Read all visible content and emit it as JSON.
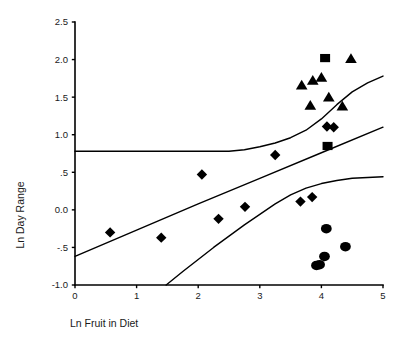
{
  "chart_data": {
    "type": "scatter",
    "title": "",
    "xlabel": "Ln Fruit in Diet",
    "ylabel": "Ln Day Range",
    "xlim": [
      0,
      5
    ],
    "ylim": [
      -1.0,
      2.5
    ],
    "xticks": [
      0,
      1,
      2,
      3,
      4,
      5
    ],
    "xticklabels": [
      "0",
      "1",
      "2",
      "3",
      "4",
      "5"
    ],
    "yticks": [
      -1.0,
      -0.5,
      0.0,
      0.5,
      1.0,
      1.5,
      2.0,
      2.5
    ],
    "yticklabels": [
      "-1.0",
      "-.5",
      "0.0",
      ".5",
      "1.0",
      "1.5",
      "2.0",
      "2.5"
    ],
    "grid": false,
    "legend": null,
    "legend_position": "none",
    "marker_color": "#000000",
    "line_color": "#000000",
    "series": [
      {
        "name": "diamond-group",
        "marker": "diamond",
        "points": [
          {
            "x": 0.57,
            "y": -0.3
          },
          {
            "x": 1.4,
            "y": -0.37
          },
          {
            "x": 2.06,
            "y": 0.47
          },
          {
            "x": 2.33,
            "y": -0.12
          },
          {
            "x": 2.76,
            "y": 0.04
          },
          {
            "x": 3.25,
            "y": 0.73
          },
          {
            "x": 3.66,
            "y": 0.11
          },
          {
            "x": 3.85,
            "y": 0.17
          },
          {
            "x": 4.09,
            "y": 1.11
          },
          {
            "x": 4.2,
            "y": 1.1
          }
        ]
      },
      {
        "name": "triangle-group",
        "marker": "triangle",
        "points": [
          {
            "x": 3.68,
            "y": 1.66
          },
          {
            "x": 3.82,
            "y": 1.39
          },
          {
            "x": 3.86,
            "y": 1.72
          },
          {
            "x": 4.0,
            "y": 1.76
          },
          {
            "x": 4.12,
            "y": 1.5
          },
          {
            "x": 4.34,
            "y": 1.38
          },
          {
            "x": 4.48,
            "y": 2.01
          }
        ]
      },
      {
        "name": "square-group",
        "marker": "square",
        "points": [
          {
            "x": 4.06,
            "y": 2.02
          },
          {
            "x": 4.1,
            "y": 0.85
          }
        ]
      },
      {
        "name": "circle-group",
        "marker": "circle",
        "points": [
          {
            "x": 4.08,
            "y": -0.25
          },
          {
            "x": 4.05,
            "y": -0.62
          },
          {
            "x": 4.39,
            "y": -0.49
          },
          {
            "x": 3.92,
            "y": -0.74
          },
          {
            "x": 3.97,
            "y": -0.73
          }
        ]
      }
    ],
    "curves": [
      {
        "name": "upper-confidence-band",
        "points": [
          {
            "x": 0.0,
            "y": 0.78
          },
          {
            "x": 0.5,
            "y": 0.78
          },
          {
            "x": 1.0,
            "y": 0.78
          },
          {
            "x": 1.5,
            "y": 0.78
          },
          {
            "x": 2.0,
            "y": 0.78
          },
          {
            "x": 2.5,
            "y": 0.78
          },
          {
            "x": 2.75,
            "y": 0.8
          },
          {
            "x": 3.0,
            "y": 0.84
          },
          {
            "x": 3.25,
            "y": 0.89
          },
          {
            "x": 3.5,
            "y": 0.96
          },
          {
            "x": 3.75,
            "y": 1.06
          },
          {
            "x": 4.0,
            "y": 1.21
          },
          {
            "x": 4.25,
            "y": 1.4
          },
          {
            "x": 4.5,
            "y": 1.57
          },
          {
            "x": 4.75,
            "y": 1.69
          },
          {
            "x": 5.0,
            "y": 1.78
          }
        ]
      },
      {
        "name": "regression-line",
        "points": [
          {
            "x": 0.0,
            "y": -0.62
          },
          {
            "x": 1.0,
            "y": -0.27
          },
          {
            "x": 2.0,
            "y": 0.08
          },
          {
            "x": 3.0,
            "y": 0.42
          },
          {
            "x": 4.0,
            "y": 0.76
          },
          {
            "x": 5.0,
            "y": 1.1
          }
        ]
      },
      {
        "name": "lower-confidence-band",
        "points": [
          {
            "x": 1.48,
            "y": -1.0
          },
          {
            "x": 1.75,
            "y": -0.82
          },
          {
            "x": 2.0,
            "y": -0.66
          },
          {
            "x": 2.25,
            "y": -0.5
          },
          {
            "x": 2.5,
            "y": -0.35
          },
          {
            "x": 2.75,
            "y": -0.2
          },
          {
            "x": 3.0,
            "y": -0.06
          },
          {
            "x": 3.25,
            "y": 0.08
          },
          {
            "x": 3.5,
            "y": 0.2
          },
          {
            "x": 3.75,
            "y": 0.29
          },
          {
            "x": 4.0,
            "y": 0.35
          },
          {
            "x": 4.25,
            "y": 0.39
          },
          {
            "x": 4.5,
            "y": 0.42
          },
          {
            "x": 4.75,
            "y": 0.43
          },
          {
            "x": 5.0,
            "y": 0.44
          }
        ]
      }
    ]
  }
}
